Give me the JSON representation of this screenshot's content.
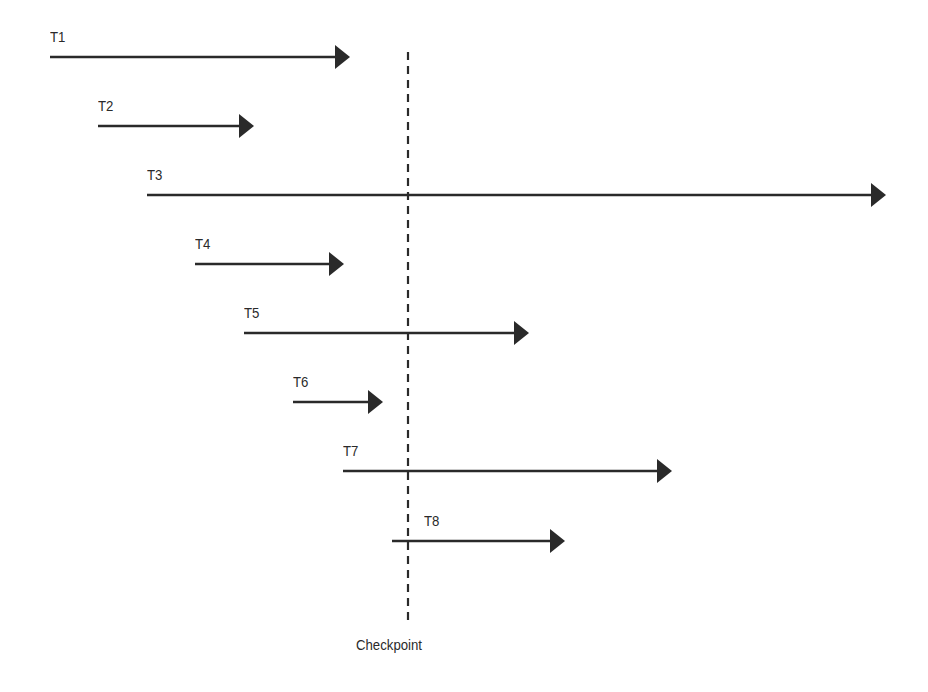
{
  "diagram": {
    "type": "transaction-timeline",
    "colors": {
      "line": "#2a2a2a",
      "background": "#ffffff"
    },
    "checkpoint": {
      "label": "Checkpoint",
      "x": 408,
      "y_top": 52,
      "y_bottom": 622
    },
    "transactions": [
      {
        "id": "T1",
        "label": "T1",
        "x_start": 50,
        "x_end": 350,
        "y": 57
      },
      {
        "id": "T2",
        "label": "T2",
        "x_start": 98,
        "x_end": 254,
        "y": 126
      },
      {
        "id": "T3",
        "label": "T3",
        "x_start": 147,
        "x_end": 886,
        "y": 195
      },
      {
        "id": "T4",
        "label": "T4",
        "x_start": 195,
        "x_end": 344,
        "y": 264
      },
      {
        "id": "T5",
        "label": "T5",
        "x_start": 244,
        "x_end": 529,
        "y": 333
      },
      {
        "id": "T6",
        "label": "T6",
        "x_start": 293,
        "x_end": 383,
        "y": 402
      },
      {
        "id": "T7",
        "label": "T7",
        "x_start": 343,
        "x_end": 672,
        "y": 471
      },
      {
        "id": "T8",
        "label": "T8",
        "x_start": 392,
        "x_end": 565,
        "y": 541
      }
    ]
  }
}
